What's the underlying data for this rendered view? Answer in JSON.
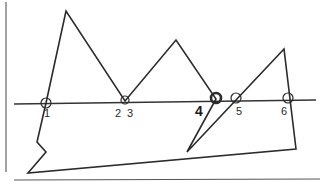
{
  "diagram": {
    "stroke_color": "#2b2b2b",
    "baseline_y": 103,
    "labels": [
      {
        "id": "1",
        "text": "1",
        "x": 44,
        "y": 108
      },
      {
        "id": "2",
        "text": "2",
        "x": 115,
        "y": 108
      },
      {
        "id": "3",
        "text": "3",
        "x": 127,
        "y": 108
      },
      {
        "id": "4",
        "text": "4",
        "x": 195,
        "y": 105
      },
      {
        "id": "5",
        "text": "5",
        "x": 236,
        "y": 106
      },
      {
        "id": "6",
        "text": "6",
        "x": 281,
        "y": 106
      }
    ],
    "crossing_points": [
      {
        "id": "1",
        "x": 46,
        "y": 103,
        "r": 5
      },
      {
        "id": "2-3",
        "x": 125,
        "y": 100,
        "r": 4
      },
      {
        "id": "4",
        "x": 216,
        "y": 98,
        "r": 5,
        "emphasized": true
      },
      {
        "id": "5",
        "x": 236,
        "y": 98,
        "r": 5
      },
      {
        "id": "6",
        "x": 288,
        "y": 98,
        "r": 5
      }
    ],
    "polygon_points": "46,103 66,11 125,101 176,40 216,99 187,152 284,49 296,149 28,173 46,152 37,142 46,103"
  }
}
